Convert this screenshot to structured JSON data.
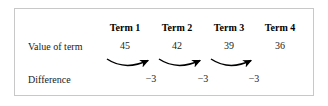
{
  "figure": {
    "caption_type": "arithmetic-sequence-difference-table",
    "row_labels": {
      "value_of_term": "Value of term",
      "difference": "Difference"
    },
    "columns": [
      {
        "header": "Term 1",
        "value": "45"
      },
      {
        "header": "Term 2",
        "value": "42"
      },
      {
        "header": "Term 3",
        "value": "39"
      },
      {
        "header": "Term 4",
        "value": "36"
      }
    ],
    "differences": [
      {
        "label": "−3"
      },
      {
        "label": "−3"
      },
      {
        "label": "−3"
      }
    ],
    "arrows": [
      {
        "name": "arrow-term1-to-term2"
      },
      {
        "name": "arrow-term2-to-term3"
      },
      {
        "name": "arrow-term3-to-term4"
      }
    ],
    "colors": {
      "border": "#c8c8c8",
      "background": "#ffffff",
      "text": "#1a1a1a",
      "arrow": "#000000"
    }
  }
}
